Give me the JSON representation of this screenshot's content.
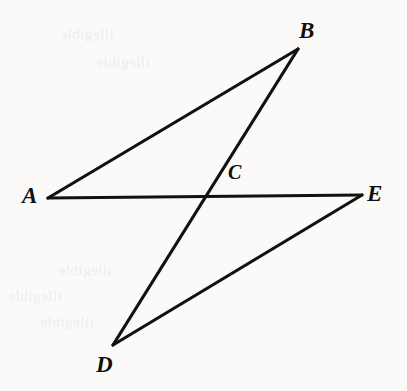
{
  "figure": {
    "type": "geometry-diagram",
    "background_color": "#fbfaf8",
    "stroke_color": "#111111",
    "stroke_width": 3.2,
    "width": 407,
    "height": 391,
    "points": [
      {
        "id": "A",
        "label": "A",
        "x": 48,
        "y": 198,
        "label_x": 22,
        "label_y": 184
      },
      {
        "id": "B",
        "label": "B",
        "x": 298,
        "y": 49,
        "label_x": 299,
        "label_y": 19
      },
      {
        "id": "C",
        "label": "C",
        "x": 203,
        "y": 197,
        "label_x": 228,
        "label_y": 162
      },
      {
        "id": "D",
        "label": "D",
        "x": 113,
        "y": 345,
        "label_x": 96,
        "label_y": 353
      },
      {
        "id": "E",
        "label": "E",
        "x": 362,
        "y": 195,
        "label_x": 367,
        "label_y": 182
      }
    ],
    "segments": [
      {
        "id": "AB",
        "from": "A",
        "to": "B",
        "x1": 48,
        "y1": 198,
        "x2": 298,
        "y2": 49
      },
      {
        "id": "BD",
        "from": "B",
        "to": "D",
        "x1": 298,
        "y1": 49,
        "x2": 113,
        "y2": 345
      },
      {
        "id": "AE",
        "from": "A",
        "to": "E",
        "x1": 48,
        "y1": 198,
        "x2": 362,
        "y2": 195
      },
      {
        "id": "DE",
        "from": "D",
        "to": "E",
        "x1": 113,
        "y1": 345,
        "x2": 362,
        "y2": 195
      }
    ],
    "ghost_text": {
      "top_left_line1": "illegible",
      "top_left_line2": "illegible",
      "bottom_left_line1": "illegible",
      "bottom_left_line2": "illegible",
      "bottom_left_line3": "illegible"
    }
  }
}
